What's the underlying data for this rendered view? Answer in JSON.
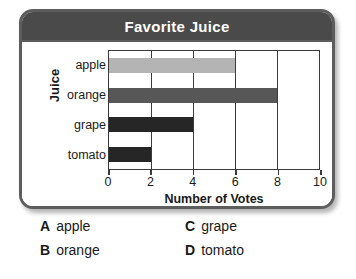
{
  "card": {
    "title": "Favorite Juice"
  },
  "chart_data": {
    "type": "bar",
    "orientation": "horizontal",
    "title": "Favorite Juice",
    "xlabel": "Number of Votes",
    "ylabel": "Juice",
    "categories": [
      "apple",
      "orange",
      "grape",
      "tomato"
    ],
    "values": [
      6,
      8,
      4,
      2
    ],
    "bar_colors": [
      "#b4b4b4",
      "#575757",
      "#262626",
      "#262626"
    ],
    "xlim": [
      0,
      10
    ],
    "xticks": [
      0,
      2,
      4,
      6,
      8,
      10
    ],
    "xtick_labels": [
      "0",
      "2",
      "4",
      "6",
      "8",
      "10"
    ],
    "grid": true,
    "legend": "none"
  },
  "options": [
    {
      "letter": "A",
      "text": "apple"
    },
    {
      "letter": "C",
      "text": "grape"
    },
    {
      "letter": "B",
      "text": "orange"
    },
    {
      "letter": "D",
      "text": "tomato"
    }
  ]
}
